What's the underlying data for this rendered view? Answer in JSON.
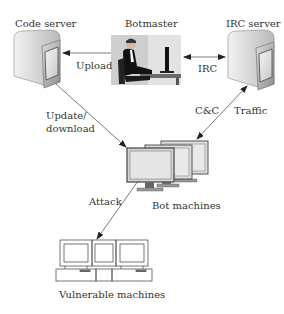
{
  "diagram": {
    "nodes": {
      "code_server": {
        "label": "Code server"
      },
      "botmaster": {
        "label": "Botmaster"
      },
      "irc_server": {
        "label": "IRC server"
      },
      "bot_machines": {
        "label": "Bot machines"
      },
      "vulnerable_machines": {
        "label": "Vulnerable machines"
      }
    },
    "edges": {
      "upload": {
        "label": "Upload",
        "from": "botmaster",
        "to": "code_server"
      },
      "irc": {
        "label": "IRC",
        "from": "botmaster",
        "to": "irc_server",
        "bidirectional": true
      },
      "update_download": {
        "label_line1": "Update/",
        "label_line2": "download",
        "from": "code_server",
        "to": "bot_machines"
      },
      "cnc_traffic": {
        "label_left": "C&C",
        "label_right": "Traffic",
        "from": "irc_server",
        "to": "bot_machines",
        "bidirectional": true
      },
      "attack": {
        "label": "Attack",
        "from": "bot_machines",
        "to": "vulnerable_machines"
      }
    }
  }
}
